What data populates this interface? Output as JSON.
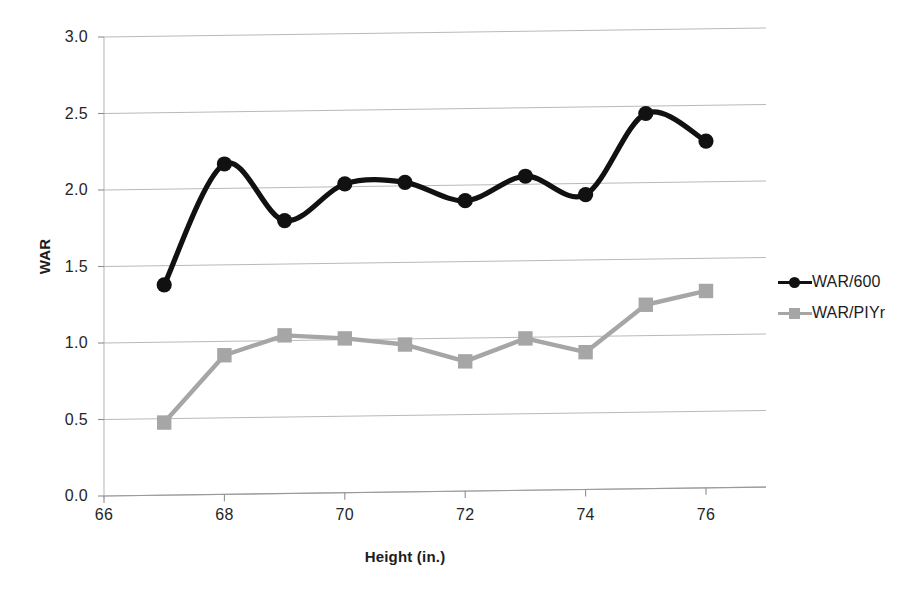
{
  "chart_data": {
    "type": "line",
    "title": "",
    "xlabel": "Height (in.)",
    "ylabel": "WAR",
    "x": [
      67,
      68,
      69,
      70,
      71,
      72,
      73,
      74,
      75,
      76
    ],
    "xlim": [
      66,
      76
    ],
    "ylim": [
      0.0,
      3.0
    ],
    "xticks": [
      "66",
      "68",
      "70",
      "72",
      "74",
      "76"
    ],
    "xtick_values": [
      66,
      68,
      70,
      72,
      74,
      76
    ],
    "yticks": [
      "0.0",
      "0.5",
      "1.0",
      "1.5",
      "2.0",
      "2.5",
      "3.0"
    ],
    "ytick_values": [
      0.0,
      0.5,
      1.0,
      1.5,
      2.0,
      2.5,
      3.0
    ],
    "grid": true,
    "grid_axis": "y",
    "legend_position": "right",
    "series": [
      {
        "name": "WAR/600",
        "color": "#111111",
        "marker": "circle",
        "smooth": true,
        "values": [
          1.38,
          2.17,
          1.8,
          2.04,
          2.05,
          1.93,
          2.09,
          1.97,
          2.5,
          2.32
        ]
      },
      {
        "name": "WAR/PIYr",
        "color": "#a6a6a6",
        "marker": "square",
        "smooth": false,
        "values": [
          0.48,
          0.92,
          1.05,
          1.03,
          0.99,
          0.88,
          1.03,
          0.94,
          1.25,
          1.34
        ]
      }
    ]
  },
  "legend": {
    "items": [
      {
        "label": "WAR/600"
      },
      {
        "label": "WAR/PIYr"
      }
    ]
  }
}
